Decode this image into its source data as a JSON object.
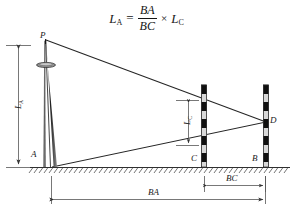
{
  "figure": {
    "type": "engineering-survey-diagram",
    "formula": {
      "lhs_symbol": "L",
      "lhs_subscript": "A",
      "equals": "=",
      "numerator": "BA",
      "denominator": "BC",
      "times": "×",
      "rhs_symbol": "L",
      "rhs_subscript": "C"
    },
    "points": {
      "apex": "P",
      "tower_base": "A",
      "near_staff_base": "C",
      "far_staff_base": "B",
      "sight_intersection": "D"
    },
    "dimensions": {
      "tower_height": {
        "symbol": "L",
        "subscript": "A",
        "orientation": "vertical"
      },
      "staff_reading": {
        "symbol": "L",
        "subscript": "C",
        "orientation": "vertical"
      },
      "baseline_long": {
        "label": "BA",
        "orientation": "horizontal"
      },
      "baseline_short": {
        "label": "BC",
        "orientation": "horizontal"
      }
    },
    "colors": {
      "line": "#2a2a2a",
      "staff_dark": "#101010",
      "staff_light": "#d8d8d8",
      "ground": "#3a3a3a",
      "dimension": "#4a4a4a",
      "background": "#ffffff"
    },
    "elements": {
      "tower": "slender-mast-with-platform-disc",
      "near_staff": "graduated-leveling-staff-at-C",
      "far_staff": "graduated-leveling-staff-at-B",
      "ground": "hatched-ground-line",
      "sight_line_upper": "P-to-D",
      "sight_line_lower": "A-to-D"
    }
  }
}
